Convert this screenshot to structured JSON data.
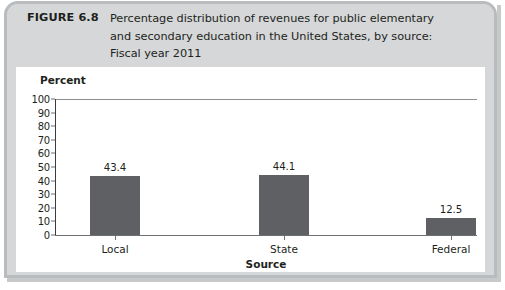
{
  "figure": {
    "number_label": "FIGURE 6.8",
    "caption_lines": [
      "Percentage distribution of revenues for public elementary",
      "and secondary education in the United States, by source:",
      "Fiscal year 2011"
    ]
  },
  "colors": {
    "bar_fill": "#5e6063",
    "header_background": "#d5d7d9",
    "frame_border": "#b9bcbf",
    "plot_background": "#ffffff",
    "text": "#1d1f20"
  },
  "chart_data": {
    "type": "bar",
    "title": "Percentage distribution of revenues for public elementary and secondary education in the United States, by source: Fiscal year 2011",
    "categories": [
      "Local",
      "State",
      "Federal"
    ],
    "values": [
      43.4,
      44.1,
      12.5
    ],
    "data_labels": [
      "43.4",
      "44.1",
      "12.5"
    ],
    "xlabel": "Source",
    "ylabel": "Percent",
    "ylim": [
      0,
      100
    ],
    "ytick_step": 10,
    "ytick_labels": [
      "100",
      "90",
      "80",
      "70",
      "60",
      "50",
      "40",
      "30",
      "20",
      "10",
      "0"
    ],
    "ytick_values": [
      100,
      90,
      80,
      70,
      60,
      50,
      40,
      30,
      20,
      10,
      0
    ],
    "grid": false,
    "legend": false,
    "legend_position": "none"
  }
}
